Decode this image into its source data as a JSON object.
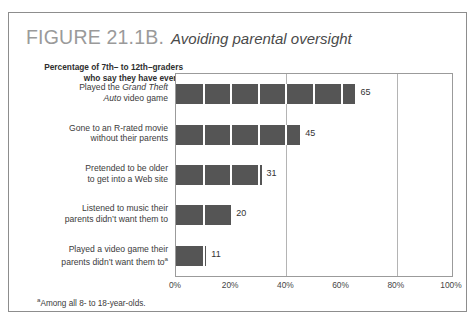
{
  "figure": {
    "number": "FIGURE 21.1B.",
    "caption": "Avoiding parental oversight"
  },
  "subtitle": {
    "line1": "Percentage of 7th– to 12th–graders",
    "line2": "who say they have ever..."
  },
  "footnote": {
    "marker": "a",
    "text": "Among all 8- to 18-year-olds."
  },
  "chart_data": {
    "type": "bar",
    "orientation": "horizontal",
    "title": "Avoiding parental oversight",
    "subtitle": "Percentage of 7th– to 12th–graders who say they have ever...",
    "categories": [
      "Played the Grand Theft Auto video game",
      "Gone to an R-rated movie without their parents",
      "Pretended to be older to get into a Web site",
      "Listened to music their parents didn't want them to",
      "Played a video game their parents didn't want them to"
    ],
    "category_lines": [
      [
        "Played the ",
        "Grand Theft",
        "",
        "Auto",
        " video game"
      ],
      [
        "Gone to an R-rated movie",
        "without their parents"
      ],
      [
        "Pretended to be older",
        "to get into a Web site"
      ],
      [
        "Listened to music their",
        "parents didn't want them to"
      ],
      [
        "Played a video game their",
        "parents didn't want them to"
      ]
    ],
    "values": [
      65,
      45,
      31,
      20,
      11
    ],
    "value_labels": [
      "65",
      "45",
      "31",
      "20",
      "11"
    ],
    "xlabel": "",
    "ylabel": "",
    "xlim": [
      0,
      100
    ],
    "xticks": [
      0,
      20,
      40,
      60,
      80,
      100
    ],
    "xtick_labels": [
      "0%",
      "20%",
      "40%",
      "60%",
      "80%",
      "100%"
    ],
    "gridlines_at": [
      40,
      80
    ],
    "grid": true,
    "legend": "none",
    "bar_color": "#555555",
    "segment_width_percent": 10
  }
}
